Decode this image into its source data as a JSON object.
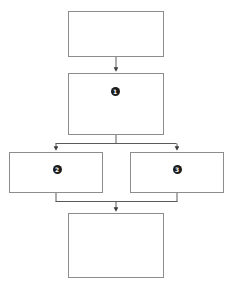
{
  "diagram": {
    "type": "flowchart",
    "orientation": "top-to-bottom",
    "background_color": "#ffffff",
    "border_color": "#8d8d8d",
    "connector_color": "#5a5a5a",
    "marker_fill_color": "#1c1c1c",
    "marker_text_color": "#ffffff",
    "nodes": [
      {
        "id": "node-top",
        "name": "top-box",
        "label": "",
        "marker": "",
        "x": 68,
        "y": 11,
        "width": 96,
        "height": 46
      },
      {
        "id": "node-step-1",
        "name": "step-one-box",
        "label": "",
        "marker": "1",
        "x": 68,
        "y": 73,
        "width": 96,
        "height": 62
      },
      {
        "id": "node-step-2",
        "name": "step-two-box",
        "label": "",
        "marker": "2",
        "x": 9,
        "y": 152,
        "width": 94,
        "height": 41
      },
      {
        "id": "node-step-3",
        "name": "step-three-box",
        "label": "",
        "marker": "3",
        "x": 130,
        "y": 152,
        "width": 94,
        "height": 41
      },
      {
        "id": "node-bottom",
        "name": "bottom-box",
        "label": "",
        "marker": "",
        "x": 68,
        "y": 213,
        "width": 96,
        "height": 65
      }
    ],
    "markers": [
      {
        "id": "marker-1",
        "value": "1",
        "cx": 115,
        "cy": 91
      },
      {
        "id": "marker-2",
        "value": "2",
        "cx": 57,
        "cy": 169
      },
      {
        "id": "marker-3",
        "value": "3",
        "cx": 177,
        "cy": 169
      }
    ],
    "connectors": [
      {
        "id": "connector-top-to-step1",
        "from": "node-top",
        "to": "node-step-1",
        "kind": "straight-arrow"
      },
      {
        "id": "connector-step1-fork",
        "from": "node-step-1",
        "to": "node-step-2,node-step-3",
        "kind": "fork-arrow"
      },
      {
        "id": "connector-merge-bottom",
        "from": "node-step-2,node-step-3",
        "to": "node-bottom",
        "kind": "merge-arrow"
      }
    ]
  }
}
